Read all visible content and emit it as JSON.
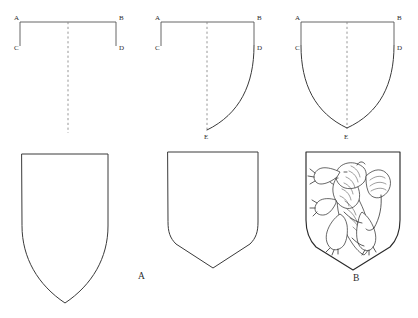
{
  "figure": {
    "background_color": "#ffffff",
    "line_color": "#3a3a3a",
    "guide_color": "#555555",
    "dash_color": "#8a8a8a"
  },
  "panels": [
    {
      "id": "panel-top-left",
      "step": 1,
      "description": "Rectangle top chief with side drops and central vertical dashed axis",
      "vertex_labels": [
        {
          "name": "A",
          "text": "A",
          "x": 14,
          "y": 20
        },
        {
          "name": "B",
          "text": "B",
          "x": 120,
          "y": 20
        },
        {
          "name": "C",
          "text": "C",
          "x": 15,
          "y": 48
        },
        {
          "name": "D",
          "text": "D",
          "x": 120,
          "y": 48
        }
      ]
    },
    {
      "id": "panel-top-middle",
      "step": 2,
      "description": "Half shield: right curve drawn from D to point E on the axis",
      "vertex_labels": [
        {
          "name": "A",
          "text": "A",
          "x": 155,
          "y": 20
        },
        {
          "name": "B",
          "text": "B",
          "x": 258,
          "y": 20
        },
        {
          "name": "C",
          "text": "C",
          "x": 156,
          "y": 48
        },
        {
          "name": "D",
          "text": "D",
          "x": 258,
          "y": 48
        },
        {
          "name": "E",
          "text": "E",
          "x": 205,
          "y": 137
        }
      ]
    },
    {
      "id": "panel-top-right",
      "step": 3,
      "description": "Full shield outline: both curves from C and D meeting at point E",
      "vertex_labels": [
        {
          "name": "A",
          "text": "A",
          "x": 296,
          "y": 20
        },
        {
          "name": "B",
          "text": "B",
          "x": 398,
          "y": 20
        },
        {
          "name": "C",
          "text": "C",
          "x": 297,
          "y": 48
        },
        {
          "name": "D",
          "text": "D",
          "x": 398,
          "y": 48
        },
        {
          "name": "E",
          "text": "E",
          "x": 345,
          "y": 137
        }
      ]
    },
    {
      "id": "panel-bottom-left",
      "step": 4,
      "description": "Finished tall pointed shield outline, blank"
    },
    {
      "id": "panel-bottom-middle",
      "step": 5,
      "description": "Finished short shield with angled chevron base, blank",
      "caption": "A"
    },
    {
      "id": "panel-bottom-right",
      "step": 6,
      "description": "Finished shield charged with a lion rampant",
      "caption": "B"
    }
  ],
  "captions": [
    {
      "name": "caption-a",
      "text": "A",
      "x": 141,
      "y": 276
    },
    {
      "name": "caption-b",
      "text": "B",
      "x": 356,
      "y": 278
    }
  ],
  "charge": {
    "name": "lion-rampant",
    "label": "lion rampant",
    "orientation": "facing left, rampant"
  }
}
